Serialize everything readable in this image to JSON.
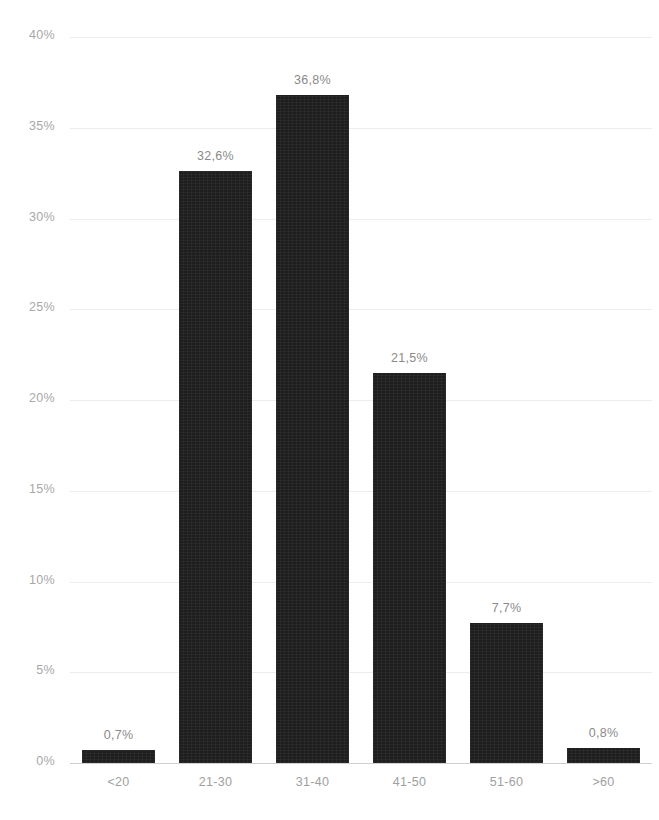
{
  "chart_data": {
    "type": "bar",
    "title": "",
    "subtitle": "",
    "xlabel": "",
    "ylabel": "",
    "categories": [
      "<20",
      "21-30",
      "31-40",
      "41-50",
      "51-60",
      ">60"
    ],
    "values": [
      0.7,
      32.6,
      36.8,
      21.5,
      7.7,
      0.8
    ],
    "data_labels": [
      "0,7%",
      "32,6%",
      "36,8%",
      "21,5%",
      "7,7%",
      "0,8%"
    ],
    "ylim": [
      0,
      40
    ],
    "ytick_values": [
      0,
      5,
      10,
      15,
      20,
      25,
      30,
      35,
      40
    ],
    "ytick_labels": [
      "0%",
      "5%",
      "10%",
      "15%",
      "20%",
      "25%",
      "30%",
      "35%",
      "40%"
    ],
    "grid": true,
    "grid_axis": "y",
    "legend": false,
    "legend_position": "none",
    "series": [
      {
        "name": "",
        "values": [
          0.7,
          32.6,
          36.8,
          21.5,
          7.7,
          0.8
        ]
      }
    ],
    "decimal_separator": ",",
    "colors": {
      "bar": "#1e1e1e",
      "gridline": "#ededed",
      "axis_line": "#d0d0d0",
      "y_tick_label": "#a8a8a8",
      "x_tick_label": "#a0a0a0",
      "data_label": "#8a8a8a",
      "background": "#ffffff"
    }
  }
}
